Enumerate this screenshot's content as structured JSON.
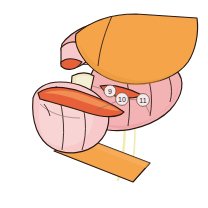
{
  "figure": {
    "background_color": "#ffffff",
    "width": 208,
    "height": 208
  },
  "palette": {
    "orange": "#F5A44A",
    "orange_shadow": "#E8973C",
    "orange_light": "#F7B468",
    "pink": "#F3B2B4",
    "pink_light": "#F7C9CA",
    "pink_deep": "#EE9FA3",
    "pink_pale": "#F8D6D6",
    "red_orange": "#E8603A",
    "red_orange_dark": "#D9502C",
    "cream": "#EFE7C2",
    "cream_pale": "#F6F1D8",
    "yellow_thread": "#F2EBB0",
    "outline": "#2b1a14",
    "callout_fill": "#F7E9EA",
    "callout_stroke": "#6b5048"
  },
  "callouts": [
    {
      "id": "callout-9",
      "label": "9",
      "cx": 110,
      "cy": 91,
      "r": 6.0
    },
    {
      "id": "callout-10",
      "label": "10",
      "cx": 122,
      "cy": 99,
      "r": 6.4
    },
    {
      "id": "callout-11",
      "label": "11",
      "cx": 143,
      "cy": 100,
      "r": 6.4
    }
  ],
  "regions": [
    {
      "name": "upper-orange-flap",
      "color": "#F5A44A"
    },
    {
      "name": "upper-flap-shadow",
      "color": "#E8973C"
    },
    {
      "name": "upper-pink-underside",
      "color": "#F3B2B4"
    },
    {
      "name": "left-pink-wedge",
      "color": "#F7C9CA"
    },
    {
      "name": "left-red-tip",
      "color": "#E8603A"
    },
    {
      "name": "lower-pink-tube",
      "color": "#F7C9CA"
    },
    {
      "name": "pink-tube-highlight",
      "color": "#F8D6D6"
    },
    {
      "name": "red-orange-band",
      "color": "#E8603A"
    },
    {
      "name": "cream-strip",
      "color": "#EFE7C2"
    },
    {
      "name": "right-pink-panel",
      "color": "#F3B2B4"
    },
    {
      "name": "lower-orange-strip",
      "color": "#F5A44A"
    },
    {
      "name": "yellow-thread",
      "color": "#F2EBB0"
    }
  ]
}
